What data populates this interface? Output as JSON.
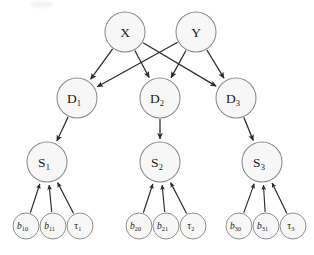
{
  "figure": {
    "type": "directed-acyclic-graph",
    "title": ""
  },
  "style": {
    "node_fill": "#f7f7f7",
    "node_stroke": "#8a8a8a",
    "edge_color": "#2b2b2b",
    "text_color": "#1a1a1a",
    "background": "#ffffff"
  },
  "nodes": {
    "roots": [
      {
        "id": "X",
        "base": "X",
        "sub": "",
        "cx": 125,
        "cy": 32,
        "r": 20
      },
      {
        "id": "Y",
        "base": "Y",
        "sub": "",
        "cx": 196,
        "cy": 32,
        "r": 20
      }
    ],
    "decisions": [
      {
        "id": "D1",
        "base": "D",
        "sub": "1",
        "cx": 77,
        "cy": 98,
        "r": 20
      },
      {
        "id": "D2",
        "base": "D",
        "sub": "2",
        "cx": 160,
        "cy": 98,
        "r": 20
      },
      {
        "id": "D3",
        "base": "D",
        "sub": "3",
        "cx": 236,
        "cy": 98,
        "r": 20
      }
    ],
    "states": [
      {
        "id": "S1",
        "base": "S",
        "sub": "1",
        "cx": 47,
        "cy": 162,
        "r": 20
      },
      {
        "id": "S2",
        "base": "S",
        "sub": "2",
        "cx": 160,
        "cy": 162,
        "r": 20
      },
      {
        "id": "S3",
        "base": "S",
        "sub": "3",
        "cx": 262,
        "cy": 162,
        "r": 20
      }
    ],
    "leaves": [
      {
        "id": "b10",
        "base": "b",
        "sub": "10",
        "italic": true,
        "cx": 26,
        "cy": 226,
        "r": 13
      },
      {
        "id": "b11",
        "base": "b",
        "sub": "11",
        "italic": true,
        "cx": 53,
        "cy": 226,
        "r": 13
      },
      {
        "id": "t1",
        "base": "τ",
        "sub": "1",
        "italic": false,
        "cx": 80,
        "cy": 226,
        "r": 13
      },
      {
        "id": "b20",
        "base": "b",
        "sub": "20",
        "italic": true,
        "cx": 139,
        "cy": 226,
        "r": 13
      },
      {
        "id": "b21",
        "base": "b",
        "sub": "21",
        "italic": true,
        "cx": 166,
        "cy": 226,
        "r": 13
      },
      {
        "id": "t2",
        "base": "τ",
        "sub": "2",
        "italic": false,
        "cx": 193,
        "cy": 226,
        "r": 13
      },
      {
        "id": "b30",
        "base": "b",
        "sub": "30",
        "italic": true,
        "cx": 239,
        "cy": 226,
        "r": 13
      },
      {
        "id": "b31",
        "base": "b",
        "sub": "31",
        "italic": true,
        "cx": 266,
        "cy": 226,
        "r": 13
      },
      {
        "id": "t3",
        "base": "τ",
        "sub": "3",
        "italic": false,
        "cx": 293,
        "cy": 226,
        "r": 13
      }
    ]
  },
  "edges": [
    {
      "from": "X",
      "to": "D1"
    },
    {
      "from": "X",
      "to": "D2"
    },
    {
      "from": "X",
      "to": "D3"
    },
    {
      "from": "Y",
      "to": "D1"
    },
    {
      "from": "Y",
      "to": "D2"
    },
    {
      "from": "Y",
      "to": "D3"
    },
    {
      "from": "D1",
      "to": "S1"
    },
    {
      "from": "D2",
      "to": "S2"
    },
    {
      "from": "D3",
      "to": "S3"
    },
    {
      "from": "b10",
      "to": "S1"
    },
    {
      "from": "b11",
      "to": "S1"
    },
    {
      "from": "t1",
      "to": "S1"
    },
    {
      "from": "b20",
      "to": "S2"
    },
    {
      "from": "b21",
      "to": "S2"
    },
    {
      "from": "t2",
      "to": "S2"
    },
    {
      "from": "b30",
      "to": "S3"
    },
    {
      "from": "b31",
      "to": "S3"
    },
    {
      "from": "t3",
      "to": "S3"
    }
  ]
}
